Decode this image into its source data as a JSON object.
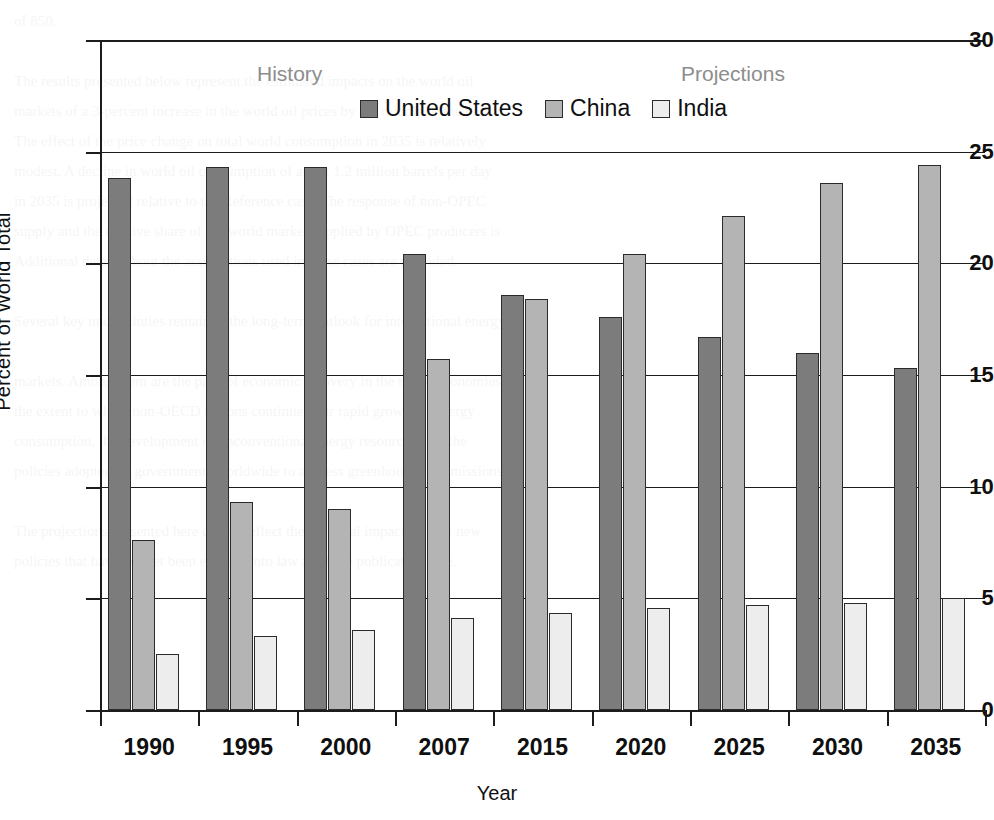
{
  "chart_data": {
    "type": "bar",
    "title": "",
    "xlabel": "Year",
    "ylabel": "Percent of World Total",
    "categories": [
      "1990",
      "1995",
      "2000",
      "2007",
      "2015",
      "2020",
      "2025",
      "2030",
      "2035"
    ],
    "series": [
      {
        "name": "United States",
        "color": "#7c7c7c",
        "values": [
          23.8,
          24.3,
          24.3,
          20.4,
          18.6,
          17.6,
          16.7,
          16.0,
          15.3
        ]
      },
      {
        "name": "China",
        "color": "#b4b4b4",
        "values": [
          7.6,
          9.3,
          9.0,
          15.7,
          18.4,
          20.4,
          22.1,
          23.6,
          24.4
        ]
      },
      {
        "name": "India",
        "color": "#ededed",
        "values": [
          2.5,
          3.3,
          3.6,
          4.1,
          4.35,
          4.55,
          4.7,
          4.8,
          5.0
        ]
      }
    ],
    "ylim": [
      0,
      30
    ],
    "yticks": [
      "0",
      "5",
      "10",
      "15",
      "20",
      "25",
      "30"
    ],
    "ytick_values": [
      0,
      5,
      10,
      15,
      20,
      25,
      30
    ],
    "grid": true,
    "legend_position": "top-center",
    "annotations": [
      {
        "name": "history",
        "text": "History"
      },
      {
        "name": "projections",
        "text": "Projections"
      }
    ]
  },
  "legend": {
    "items": [
      {
        "label": "United States",
        "swatch": "us"
      },
      {
        "label": "China",
        "swatch": "china"
      },
      {
        "label": "India",
        "swatch": "india"
      }
    ]
  },
  "annotations": {
    "history": "History",
    "projections": "Projections"
  },
  "axes": {
    "y_title": "Percent of World Total",
    "x_title": "Year"
  },
  "page_background_text": "of 850.\n\nThe results presented below represent the estimated impacts on the world oil\nmarkets of a 3-percent increase in the world oil prices by the middle of the period.\nThe effect of the price change on total world consumption in 2035 is relatively\nmodest. A decline in world oil consumption of about 1.2 million barrels per day\nin 2035 is projected relative to the Reference case. The response of non-OPEC\nsupply and the relative share of the world market supplied by OPEC producers is\nAdditional details about the assumptions used in these cases are provided.\n\nSeveral key uncertainties remain in the long-term outlook for international energy\n\nmarkets. Among them are the pace of economic recovery in the major economies,\nthe extent to which non-OECD nations continue their rapid growth in energy\nconsumption, the development of unconventional energy resources, and the\npolicies adopted by governments worldwide to address greenhouse gas emissions.\n\nThe projections presented here do not reflect the potential impacts of any new\npolicies that have not yet been enacted into law as of the publication date."
}
